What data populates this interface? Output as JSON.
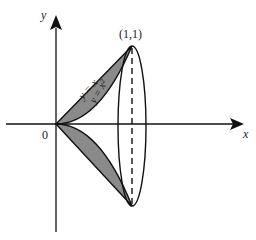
{
  "diagram": {
    "type": "solid-of-revolution",
    "axes": {
      "x_label": "x",
      "y_label": "y",
      "origin_label": "0"
    },
    "curves": [
      {
        "label": "y = x",
        "equation": "y = x"
      },
      {
        "label": "y = x²",
        "equation": "y = x^2"
      }
    ],
    "point_label": "(1,1)",
    "colors": {
      "shade": "#8a8a8a",
      "stroke": "#111111",
      "background": "#ffffff"
    }
  }
}
